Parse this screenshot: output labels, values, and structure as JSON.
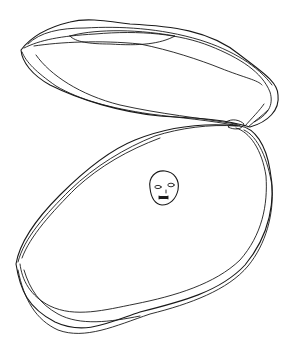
{
  "drawing": {
    "subject": "Open oyster shell with a pearl that has a face",
    "style": "hand-drawn black line sketch on white background",
    "colors": {
      "background": "#ffffff",
      "ink": "#1a1a1a"
    },
    "elements": {
      "upper_shell": "upper-shell",
      "lower_shell": "lower-shell",
      "pearl_face": "pearl-face"
    }
  }
}
